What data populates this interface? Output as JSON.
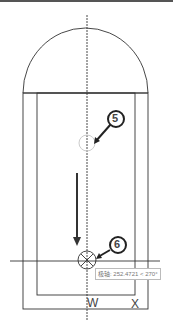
{
  "callouts": [
    {
      "number": "5"
    },
    {
      "number": "6"
    }
  ],
  "tooltip": {
    "text": "极轴: 252.4721 < 270°"
  },
  "labels": {
    "w": "W",
    "x": "X"
  }
}
